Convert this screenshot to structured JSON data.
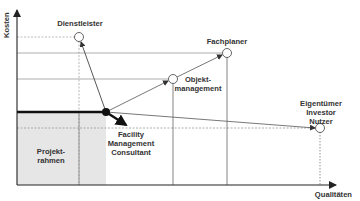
{
  "diagram": {
    "y_axis_label": "Kosten",
    "x_axis_label": "Qualitäten",
    "region_label_line1": "Projekt-",
    "region_label_line2": "rahmen",
    "nodes": {
      "dienstleister": {
        "label": "Dienstleister"
      },
      "fachplaner": {
        "label": "Fachplaner"
      },
      "objektmanagement": {
        "line1": "Objekt-",
        "line2": "management"
      },
      "fm_consultant": {
        "line1": "Facility",
        "line2": "Management",
        "line3": "Consultant"
      },
      "eigentuemer": {
        "line1": "Eigentümer",
        "line2": "Investor",
        "line3": "Nutzer"
      }
    },
    "colors": {
      "axis": "#333333",
      "line": "#555555",
      "grid": "#999999",
      "shade": "#e6e6e6",
      "emphasis": "#111111"
    }
  }
}
